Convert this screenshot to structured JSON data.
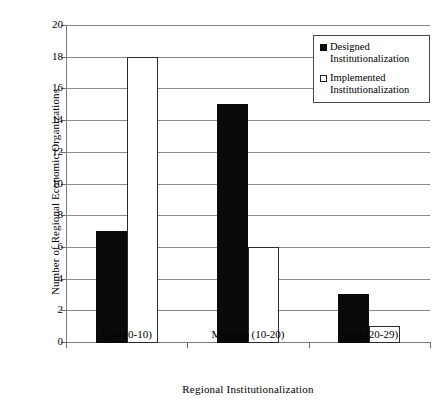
{
  "chart_data": {
    "type": "bar",
    "title": "",
    "subtitle": "",
    "xlabel": "Regional Institutionalization",
    "ylabel": "Number of Regional Economic Organizations",
    "categories": [
      "Low (0-10)",
      "Medium (10-20)",
      "High (20-29)"
    ],
    "series": [
      {
        "name": "Designed Institutionalization",
        "values": [
          7,
          15,
          3
        ],
        "fill": "#000000",
        "stroke": "#000000",
        "legend_marker": "filled-square"
      },
      {
        "name": "Implemented Institutionalization",
        "values": [
          18,
          6,
          1
        ],
        "fill": "#ffffff",
        "stroke": "#2b2b2b",
        "legend_marker": "open-square"
      }
    ],
    "ylim": [
      0,
      20
    ],
    "ytick_step": 2,
    "yticks": [
      "0",
      "2",
      "4",
      "6",
      "8",
      "10",
      "12",
      "14",
      "16",
      "18",
      "20"
    ],
    "grid": "horizontal",
    "legend_position": "top-right",
    "background": "#ffffff",
    "axis_color": "#7b7b7b",
    "grid_color": "#8a8a8a"
  },
  "legend": {
    "entries": [
      {
        "label": "Designed\nInstitutionalization"
      },
      {
        "label": "Implemented\nInstitutionalization"
      }
    ]
  }
}
